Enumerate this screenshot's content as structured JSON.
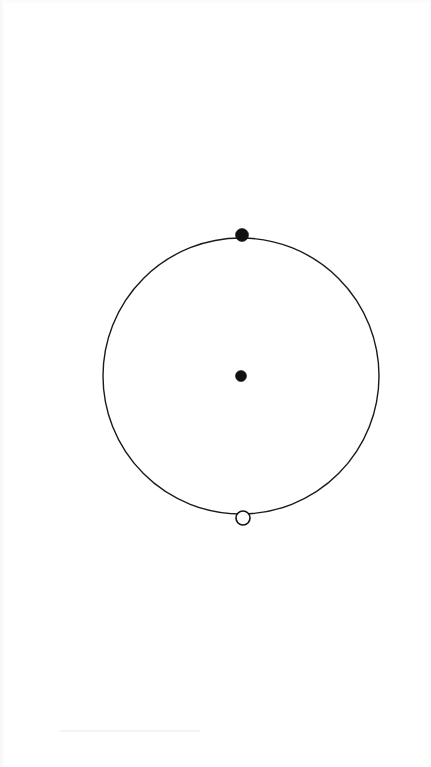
{
  "figure": {
    "type": "geometry-diagram",
    "background_color": "#ffffff",
    "width": 431,
    "height": 767,
    "title": "",
    "caption": ""
  },
  "chart_data": {
    "type": "scatter",
    "title": "",
    "subtitle": "",
    "xlabel": "",
    "ylabel": "",
    "grid": false,
    "legend": "none",
    "axes_visible": false,
    "tick_labels": [],
    "annotations": [],
    "shapes": [
      {
        "name": "main-circle",
        "kind": "circle",
        "center_x": 241,
        "center_y": 376,
        "radius": 138,
        "stroke_color": "#1a1a1a",
        "stroke_width": 1.4,
        "fill": "none"
      }
    ],
    "points": [
      {
        "name": "center-point",
        "label": "",
        "x": 241,
        "y": 376,
        "marker": "filled-circle",
        "diameter": 11,
        "fill_color": "#111111",
        "stroke_color": "#111111",
        "position_description": "center of circle"
      },
      {
        "name": "top-point",
        "label": "",
        "x": 242,
        "y": 235,
        "marker": "filled-circle",
        "diameter": 13,
        "fill_color": "#111111",
        "stroke_color": "#111111",
        "position_description": "on circle, topmost"
      },
      {
        "name": "bottom-point",
        "label": "",
        "x": 243,
        "y": 518,
        "marker": "open-circle",
        "diameter": 14,
        "fill_color": "#ffffff",
        "stroke_color": "#111111",
        "stroke_width": 1.6,
        "position_description": "on circle, bottommost"
      }
    ]
  }
}
